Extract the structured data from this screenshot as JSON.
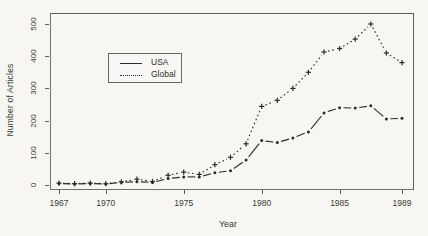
{
  "chart_data": {
    "type": "line",
    "title": "",
    "xlabel": "Year",
    "ylabel": "Number of Articles",
    "x": [
      1967,
      1968,
      1969,
      1970,
      1971,
      1972,
      1973,
      1974,
      1975,
      1976,
      1977,
      1978,
      1979,
      1980,
      1981,
      1982,
      1983,
      1984,
      1985,
      1986,
      1987,
      1988,
      1989
    ],
    "series": [
      {
        "name": "USA",
        "line_style": "solid",
        "marker": "dot",
        "values": [
          5,
          3,
          5,
          3,
          8,
          10,
          8,
          20,
          25,
          25,
          38,
          44,
          78,
          138,
          132,
          146,
          165,
          224,
          240,
          239,
          246,
          205,
          207
        ]
      },
      {
        "name": "Global",
        "line_style": "dotted",
        "marker": "plus",
        "values": [
          6,
          4,
          6,
          4,
          10,
          18,
          11,
          30,
          40,
          33,
          63,
          86,
          128,
          244,
          263,
          300,
          350,
          413,
          424,
          453,
          500,
          410,
          380
        ]
      }
    ],
    "xlim": [
      1966.2,
      1989.8
    ],
    "ylim": [
      0,
      534
    ],
    "ytick_values": [
      0,
      100,
      200,
      300,
      400,
      500
    ],
    "ytick_labels": [
      "0",
      "100",
      "200",
      "300",
      "400",
      "500"
    ],
    "xtick_values": [
      1967,
      1970,
      1975,
      1980,
      1985,
      1989
    ],
    "xtick_labels": [
      "1967",
      "1970",
      "1975",
      "1980",
      "1985",
      "1989"
    ],
    "grid": false,
    "legend_position": "upper-left-inside",
    "legend": [
      "USA",
      "Global"
    ],
    "ink_color": "#2b2b27",
    "paper_color": "#f7f6f2"
  }
}
